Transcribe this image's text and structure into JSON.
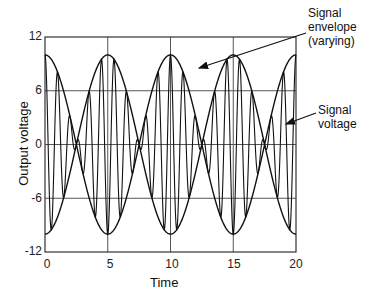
{
  "chart_data": {
    "type": "line",
    "title": "",
    "xlabel": "Time",
    "ylabel": "Output voltage",
    "xlim": [
      0,
      20
    ],
    "ylim": [
      -12,
      12
    ],
    "x_ticks": [
      "0",
      "5",
      "10",
      "15",
      "20"
    ],
    "y_ticks": [
      "12",
      "6",
      "0",
      "-6",
      "-12"
    ],
    "grid": true,
    "series": [
      {
        "name": "Signal voltage",
        "formula": "10*cos(2*pi*t/20*2)*cos(2*pi*t)",
        "carrier_period": 1,
        "envelope_amplitude": 10
      },
      {
        "name": "Signal envelope (varying)",
        "formula": "+/-10*cos(2*pi*t/10)",
        "x": [
          0,
          2.5,
          5,
          7.5,
          10,
          12.5,
          15,
          17.5,
          20
        ],
        "values_upper": [
          10,
          7.07,
          0,
          7.07,
          10,
          7.07,
          0,
          7.07,
          10
        ]
      }
    ],
    "annotations": [
      {
        "text": "Signal envelope (varying)",
        "points_to": "envelope near t=9.5, y=8"
      },
      {
        "text": "Signal voltage",
        "points_to": "signal near t=19, y=4"
      }
    ]
  },
  "labels": {
    "xlabel": "Time",
    "ylabel": "Output voltage",
    "ann_envelope_1": "Signal",
    "ann_envelope_2": "envelope",
    "ann_envelope_3": "(varying)",
    "ann_signal_1": "Signal",
    "ann_signal_2": "voltage",
    "y12": "12",
    "y6": "6",
    "y0": "0",
    "ym6": "-6",
    "ym12": "-12",
    "x0": "0",
    "x5": "5",
    "x10": "10",
    "x15": "15",
    "x20": "20"
  }
}
